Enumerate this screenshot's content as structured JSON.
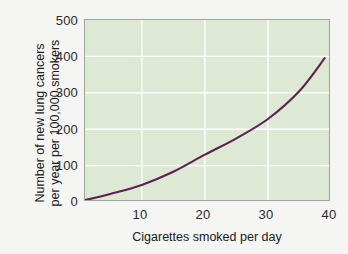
{
  "chart_data": {
    "type": "line",
    "title": "",
    "xlabel": "Cigarettes smoked per day",
    "ylabel_line1": "Number of new lung cancers",
    "ylabel_line2": "per year per 100,000 smokers",
    "xlim": [
      1,
      40
    ],
    "ylim": [
      0,
      500
    ],
    "xticks": [
      10,
      20,
      30,
      40
    ],
    "yticks": [
      0,
      100,
      200,
      300,
      400,
      500
    ],
    "xtick_labels": [
      "10",
      "20",
      "30",
      "40"
    ],
    "ytick_labels": [
      "0",
      "100",
      "200",
      "300",
      "400",
      "500"
    ],
    "grid": "white gridlines at x=10,20,30 and y=100,200,300,400",
    "legend": "none",
    "series": [
      {
        "name": "Lung cancer incidence",
        "color": "#5c2250",
        "x": [
          1,
          5,
          10,
          15,
          20,
          25,
          30,
          35,
          39
        ],
        "values": [
          5,
          22,
          47,
          83,
          130,
          175,
          228,
          305,
          395
        ]
      }
    ]
  },
  "axes": {
    "y_title_line1": "Number of new lung cancers",
    "y_title_line2": "per year per 100,000 smokers",
    "x_title": "Cigarettes smoked per day"
  },
  "colors": {
    "page_background": "#f5f5f3",
    "plot_background": "#dde9d4",
    "plot_border": "#9aa69a",
    "gridline": "#ffffff",
    "curve": "#5c2250",
    "text": "#202020"
  }
}
